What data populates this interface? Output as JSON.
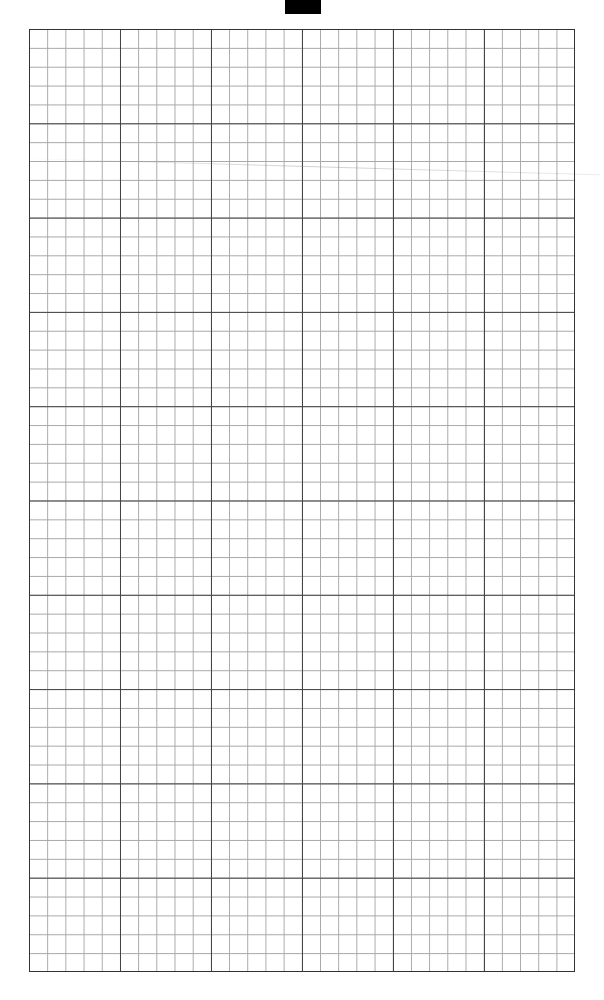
{
  "page": {
    "type": "graph-paper",
    "major_columns": 6,
    "major_rows": 10,
    "minor_per_major": 5,
    "colors": {
      "background": "#ffffff",
      "major_line": "#444444",
      "minor_line": "#a8a8a8",
      "top_tab": "#000000"
    }
  }
}
